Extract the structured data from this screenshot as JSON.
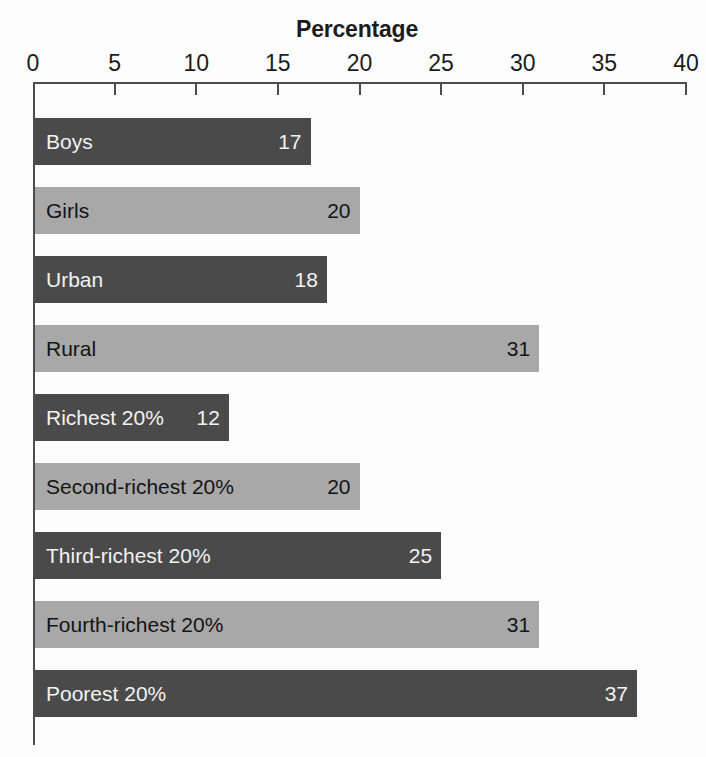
{
  "chart_data": {
    "type": "bar",
    "orientation": "horizontal",
    "title": "Percentage",
    "xlabel": "",
    "ylabel": "",
    "xlim": [
      0,
      40
    ],
    "xticks": [
      0,
      5,
      10,
      15,
      20,
      25,
      30,
      35,
      40
    ],
    "xtick_labels": [
      "0",
      "5",
      "10",
      "15",
      "20",
      "25",
      "30",
      "35",
      "40"
    ],
    "grid": false,
    "legend": null,
    "categories": [
      "Boys",
      "Girls",
      "Urban",
      "Rural",
      "Richest 20%",
      "Second-richest 20%",
      "Third-richest 20%",
      "Fourth-richest 20%",
      "Poorest 20%"
    ],
    "values": [
      17,
      20,
      18,
      31,
      12,
      20,
      25,
      31,
      37
    ],
    "bars": [
      {
        "label": "Boys",
        "value": 17,
        "value_text": "17",
        "shade": "dark"
      },
      {
        "label": "Girls",
        "value": 20,
        "value_text": "20",
        "shade": "light"
      },
      {
        "label": "Urban",
        "value": 18,
        "value_text": "18",
        "shade": "dark"
      },
      {
        "label": "Rural",
        "value": 31,
        "value_text": "31",
        "shade": "light"
      },
      {
        "label": "Richest 20%",
        "value": 12,
        "value_text": "12",
        "shade": "dark"
      },
      {
        "label": "Second-richest 20%",
        "value": 20,
        "value_text": "20",
        "shade": "light"
      },
      {
        "label": "Third-richest 20%",
        "value": 25,
        "value_text": "25",
        "shade": "dark"
      },
      {
        "label": "Fourth-richest 20%",
        "value": 31,
        "value_text": "31",
        "shade": "light"
      },
      {
        "label": "Poorest 20%",
        "value": 37,
        "value_text": "37",
        "shade": "dark"
      }
    ],
    "colors": {
      "bar_dark": "#4a4a4a",
      "bar_light": "#a8a8a8",
      "axis": "#4d4d4d",
      "text_on_dark": "#f2f2f2",
      "text_on_light": "#141414",
      "background": "#fdfdfd"
    }
  }
}
